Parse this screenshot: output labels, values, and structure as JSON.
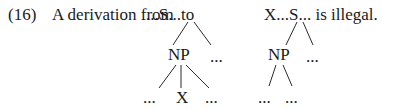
{
  "example": {
    "number": "(16)",
    "intro": "A derivation from",
    "from_string": "...S...to",
    "to_string": "X...S... is illegal."
  },
  "left_tree": {
    "root": "S",
    "np": "NP",
    "s_right": "...",
    "np_children": [
      "...",
      "X",
      "..."
    ]
  },
  "right_tree": {
    "root": "S",
    "np": "NP",
    "s_right": "...",
    "np_children": [
      "...",
      "..."
    ]
  }
}
